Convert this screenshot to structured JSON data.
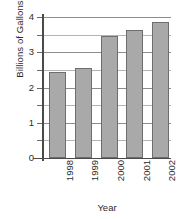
{
  "chart_data": {
    "type": "bar",
    "title": "",
    "subtitle": "",
    "xlabel": "Year",
    "ylabel": "Billions of Gallons",
    "categories": [
      "1998",
      "1999",
      "2000",
      "2001",
      "2002"
    ],
    "values": [
      2.44,
      2.55,
      3.45,
      3.62,
      3.87
    ],
    "series": [
      {
        "name": "Billions of Gallons",
        "values": [
          2.44,
          2.55,
          3.45,
          3.62,
          3.87
        ]
      }
    ],
    "ylim": [
      0,
      4
    ],
    "xlim": null,
    "ytick_labels": [
      "0",
      "1",
      "2",
      "3",
      "4"
    ],
    "ytick_values": [
      0,
      1,
      2,
      3,
      4
    ],
    "yminor_tick_values": [
      0.5,
      1.5,
      2.5,
      3.5
    ],
    "grid": true,
    "grid_axis": "y",
    "legend": false,
    "legend_position": "none",
    "annotations": [],
    "colors": {
      "bar_fill": "#a9a9a9",
      "bar_border": "#6e6e6e",
      "gridline_major": "#8c8c8c",
      "gridline_minor": "#b4b4b4",
      "axis": "#4a4a4a",
      "text": "#2b2b2b",
      "background": "#ffffff"
    }
  }
}
